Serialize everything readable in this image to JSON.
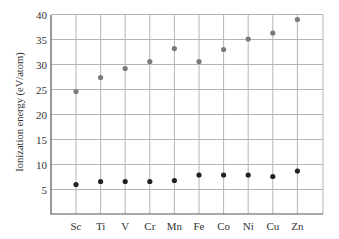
{
  "chart_data": {
    "type": "scatter",
    "title": "",
    "xlabel": "",
    "ylabel": "Ionization energy (eV/atom)",
    "categories": [
      "Sc",
      "Ti",
      "V",
      "Cr",
      "Mn",
      "Fe",
      "Co",
      "Ni",
      "Cu",
      "Zn"
    ],
    "yticks": [
      5,
      10,
      15,
      20,
      25,
      30,
      35,
      40
    ],
    "ylim": [
      0,
      40
    ],
    "grid": true,
    "legend": null,
    "series": [
      {
        "name": "Second ionization energy",
        "color": "#7a7a7a",
        "values": [
          24.6,
          27.4,
          29.2,
          30.6,
          33.2,
          30.6,
          33.0,
          35.1,
          36.3,
          39.0
        ]
      },
      {
        "name": "First ionization energy",
        "color": "#222222",
        "values": [
          6.0,
          6.6,
          6.6,
          6.6,
          6.8,
          7.9,
          7.9,
          7.9,
          7.6,
          8.7
        ]
      }
    ]
  }
}
